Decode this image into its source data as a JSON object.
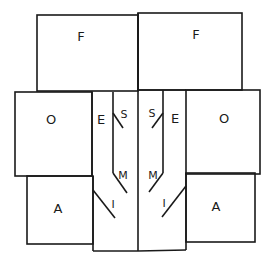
{
  "diagram": {
    "left": {
      "top_panel": "F",
      "outer_panel": "O",
      "edge_panel": "E",
      "flap_top": "S",
      "flap_mid": "M",
      "flap_low": "I",
      "bottom_panel": "A"
    },
    "right": {
      "top_panel": "F",
      "outer_panel": "O",
      "edge_panel": "E",
      "flap_top": "S",
      "flap_mid": "M",
      "flap_low": "I",
      "bottom_panel": "A"
    }
  }
}
